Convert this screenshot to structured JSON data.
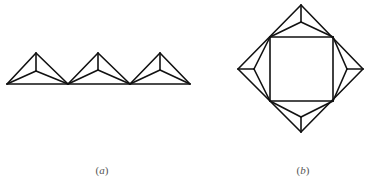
{
  "figure": {
    "stroke_color": "#111111",
    "stroke_width": 1.6,
    "panels": [
      {
        "id": "a",
        "label": "(a)",
        "label_letter": "a",
        "label_pos": [
          102,
          170
        ],
        "description": "Three adjacent triangles sharing a common base line, each with an interior point joined to its three vertices",
        "base_line": [
          [
            7,
            84
          ],
          [
            190,
            84
          ]
        ],
        "triangles": [
          {
            "left": [
              7,
              84
            ],
            "apex": [
              36,
              53
            ],
            "right": [
              68,
              84
            ],
            "inner": [
              36,
              71
            ]
          },
          {
            "left": [
              68,
              84
            ],
            "apex": [
              98,
              53
            ],
            "right": [
              130,
              84
            ],
            "inner": [
              98,
              70
            ]
          },
          {
            "left": [
              130,
              84
            ],
            "apex": [
              160,
              53
            ],
            "right": [
              190,
              84
            ],
            "inner": [
              160,
              70
            ]
          }
        ]
      },
      {
        "id": "b",
        "label": "(b)",
        "label_letter": "b",
        "label_pos": [
          303,
          170
        ],
        "description": "Square inscribed in a diamond; each of the four corner triangles contains an interior point joined to its vertices",
        "outer_diamond": {
          "top": [
            301,
            5
          ],
          "right": [
            363,
            69
          ],
          "bottom": [
            301,
            132
          ],
          "left": [
            238,
            69
          ]
        },
        "inner_square": {
          "tl": [
            270,
            37
          ],
          "tr": [
            333,
            37
          ],
          "br": [
            333,
            101
          ],
          "bl": [
            270,
            101
          ]
        },
        "inner_points": {
          "top": [
            301,
            22
          ],
          "right": [
            347,
            69
          ],
          "bottom": [
            301,
            117
          ],
          "left": [
            254,
            69
          ]
        }
      }
    ]
  }
}
